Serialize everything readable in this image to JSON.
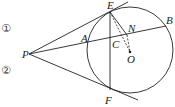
{
  "diagram": {
    "type": "geometry",
    "labels": {
      "P": "P",
      "A": "A",
      "B": "B",
      "C": "C",
      "E": "E",
      "F": "F",
      "N": "N",
      "O": "O"
    },
    "markers": {
      "first": "①",
      "second": "②"
    },
    "circle": {
      "center": "O"
    },
    "segments": [
      "PE",
      "PF",
      "PB",
      "EF",
      "EN",
      "EO",
      "NO"
    ],
    "tangents": [
      "PE",
      "PF"
    ],
    "colors": {
      "stroke": "#222222",
      "background": "#ffffff"
    }
  }
}
